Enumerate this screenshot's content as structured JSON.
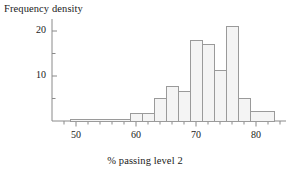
{
  "figure": {
    "title": "",
    "ylabel": "Frequency density",
    "xlabel": "% passing level 2"
  },
  "chart_data": {
    "type": "bar",
    "title": "",
    "subtitle": "",
    "xlabel": "% passing level 2",
    "ylabel": "Frequency density",
    "xlim": [
      46,
      85
    ],
    "ylim": [
      0,
      22
    ],
    "grid": false,
    "legend": null,
    "bin_width": 2,
    "xticks": [
      50,
      60,
      70,
      80
    ],
    "xtick_labels": [
      "50",
      "60",
      "70",
      "80"
    ],
    "x_minor_ticks": [
      48,
      52,
      54,
      56,
      58,
      62,
      64,
      66,
      68,
      72,
      74,
      76,
      78,
      82,
      84
    ],
    "yticks": [
      10,
      20
    ],
    "ytick_labels": [
      "10",
      "20"
    ],
    "y_minor_ticks": [
      5,
      15
    ],
    "bin_edges": [
      49,
      59,
      61,
      63,
      65,
      67,
      69,
      71,
      73,
      75,
      77,
      79,
      81,
      83
    ],
    "bars": [
      {
        "x_start": 49,
        "x_end": 59,
        "value": 0.3
      },
      {
        "x_start": 59,
        "x_end": 61,
        "value": 1.6
      },
      {
        "x_start": 61,
        "x_end": 63,
        "value": 1.6
      },
      {
        "x_start": 63,
        "x_end": 65,
        "value": 5.0
      },
      {
        "x_start": 65,
        "x_end": 67,
        "value": 7.6
      },
      {
        "x_start": 67,
        "x_end": 69,
        "value": 6.6
      },
      {
        "x_start": 69,
        "x_end": 71,
        "value": 18.0
      },
      {
        "x_start": 71,
        "x_end": 73,
        "value": 17.0
      },
      {
        "x_start": 73,
        "x_end": 75,
        "value": 11.2
      },
      {
        "x_start": 75,
        "x_end": 77,
        "value": 21.0
      },
      {
        "x_start": 77,
        "x_end": 79,
        "value": 5.0
      },
      {
        "x_start": 79,
        "x_end": 83,
        "value": 2.2
      }
    ],
    "categories": [
      "49-59",
      "59-61",
      "61-63",
      "63-65",
      "65-67",
      "67-69",
      "69-71",
      "71-73",
      "73-75",
      "75-77",
      "77-79",
      "79-83"
    ],
    "values": [
      0.3,
      1.6,
      1.6,
      5.0,
      7.6,
      6.6,
      18.0,
      17.0,
      11.2,
      21.0,
      5.0,
      2.2
    ],
    "colors": {
      "bar_fill": "#f4f4f4",
      "bar_edge": "#9a9a9a",
      "axis": "#8a8a8a",
      "text": "#1a1a1a"
    }
  }
}
